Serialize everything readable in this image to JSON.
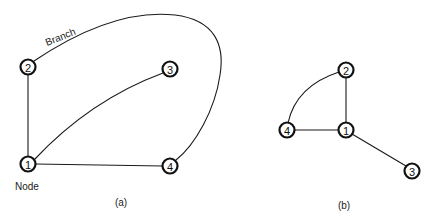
{
  "diagram_a": {
    "caption": "(a)",
    "branch_label": "Branch",
    "node_label": "Node",
    "nodes": [
      {
        "id": "1",
        "x": 28,
        "y": 164
      },
      {
        "id": "2",
        "x": 28,
        "y": 67
      },
      {
        "id": "3",
        "x": 170,
        "y": 69
      },
      {
        "id": "4",
        "x": 170,
        "y": 166
      }
    ],
    "edges": [
      {
        "from": "1",
        "to": "2"
      },
      {
        "from": "1",
        "to": "3"
      },
      {
        "from": "1",
        "to": "4"
      },
      {
        "from": "2",
        "to": "4"
      }
    ]
  },
  "diagram_b": {
    "caption": "(b)",
    "nodes": [
      {
        "id": "1",
        "x": 346,
        "y": 130
      },
      {
        "id": "2",
        "x": 346,
        "y": 70
      },
      {
        "id": "3",
        "x": 412,
        "y": 171
      },
      {
        "id": "4",
        "x": 287,
        "y": 130
      }
    ],
    "edges": [
      {
        "from": "1",
        "to": "2"
      },
      {
        "from": "1",
        "to": "3"
      },
      {
        "from": "1",
        "to": "4"
      },
      {
        "from": "2",
        "to": "4"
      }
    ]
  }
}
